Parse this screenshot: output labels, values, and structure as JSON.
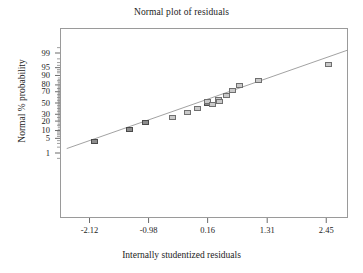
{
  "chart_data": {
    "type": "scatter",
    "title": "Normal plot of residuals",
    "xlabel": "Internally studentized residuals",
    "ylabel": "Normal % probability",
    "grid": false,
    "legend": null,
    "xlim": [
      -2.69,
      2.87
    ],
    "ylim_percent": [
      0.4,
      99.6
    ],
    "xticks": [
      -2.12,
      -0.98,
      0.16,
      1.31,
      2.45
    ],
    "xtick_labels": [
      "-2.12",
      "-0.98",
      "0.16",
      "1.31",
      "2.45"
    ],
    "yticks": [
      99,
      95,
      90,
      80,
      70,
      50,
      30,
      20,
      10,
      5,
      1
    ],
    "ytick_labels": [
      "99",
      "95",
      "90",
      "80",
      "70",
      "50",
      "30",
      "20",
      "10",
      "5",
      "1"
    ],
    "y_scale": "normal probability",
    "reference_line": {
      "label": "normal reference line",
      "x_start": -2.56,
      "y_start_percent": 1.7,
      "x_end": 2.86,
      "y_end_percent": 99.3
    },
    "points": [
      {
        "x": -2.03,
        "y_percent": 3.6
      },
      {
        "x": -1.34,
        "y_percent": 10.7
      },
      {
        "x": -1.04,
        "y_percent": 17.9
      },
      {
        "x": -0.51,
        "y_percent": 25.0
      },
      {
        "x": -0.23,
        "y_percent": 32.1
      },
      {
        "x": -0.04,
        "y_percent": 39.3
      },
      {
        "x": 0.16,
        "y_percent": 50.0
      },
      {
        "x": 0.16,
        "y_percent": 53.6
      },
      {
        "x": 0.26,
        "y_percent": 46.4
      },
      {
        "x": 0.37,
        "y_percent": 57.1
      },
      {
        "x": 0.38,
        "y_percent": 53.6
      },
      {
        "x": 0.53,
        "y_percent": 64.3
      },
      {
        "x": 0.64,
        "y_percent": 71.4
      },
      {
        "x": 0.77,
        "y_percent": 78.6
      },
      {
        "x": 1.15,
        "y_percent": 85.7
      },
      {
        "x": 2.49,
        "y_percent": 96.4
      }
    ],
    "colors": {
      "marker_fill": "#c9c9c9",
      "marker_edge": "#6f6f6f",
      "marker_fill_dark": "#8d8d8d",
      "line": "#8a8a8a",
      "frame": "#9a9a9a",
      "text": "#1c1c1c",
      "background": "#ffffff"
    }
  }
}
